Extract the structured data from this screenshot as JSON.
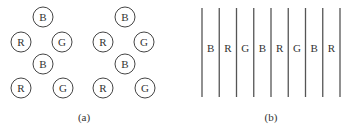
{
  "panel_a": {
    "caption": "(a)",
    "groups": [
      {
        "subpixels": [
          {
            "label": "B"
          },
          {
            "label": "R"
          },
          {
            "label": "G"
          },
          {
            "label": "B"
          },
          {
            "label": "R"
          },
          {
            "label": "G"
          }
        ]
      },
      {
        "subpixels": [
          {
            "label": "B"
          },
          {
            "label": "R"
          },
          {
            "label": "G"
          },
          {
            "label": "B"
          },
          {
            "label": "R"
          },
          {
            "label": "G"
          }
        ]
      }
    ]
  },
  "panel_b": {
    "caption": "(b)",
    "stripes": [
      "B",
      "R",
      "G",
      "B",
      "R",
      "G",
      "B",
      "R"
    ]
  }
}
